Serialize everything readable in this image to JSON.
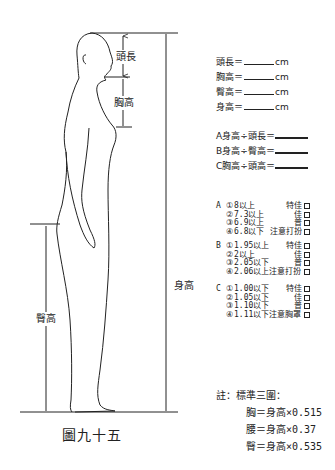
{
  "diagram": {
    "caption": "圖九十五",
    "labels": {
      "head_length": "頭長",
      "chest_height": "胸高",
      "body_height": "身高",
      "hip_height": "臀高"
    }
  },
  "measure_fields": [
    {
      "label": "頭長＝",
      "unit": "cm"
    },
    {
      "label": "胸高＝",
      "unit": "cm"
    },
    {
      "label": "臀高＝",
      "unit": "cm"
    },
    {
      "label": "身高＝",
      "unit": "cm"
    }
  ],
  "ratios": [
    {
      "text": "A身高÷頭長＝"
    },
    {
      "text": "B身高÷臀高＝"
    },
    {
      "text": "C胸高÷頭高＝"
    }
  ],
  "criteria": [
    {
      "key": "A",
      "items": [
        {
          "num": "①",
          "value": "8以上",
          "grade": "特佳"
        },
        {
          "num": "②",
          "value": "7.3以上",
          "grade": "佳"
        },
        {
          "num": "③",
          "value": "6.9以上",
          "grade": "普"
        },
        {
          "num": "④",
          "value": "6.8以下",
          "grade": "注意打扮"
        }
      ]
    },
    {
      "key": "B",
      "items": [
        {
          "num": "①",
          "value": "1.95以上",
          "grade": "特佳"
        },
        {
          "num": "②",
          "value": "2以上",
          "grade": "佳"
        },
        {
          "num": "③",
          "value": "2.05以下",
          "grade": "普"
        },
        {
          "num": "④",
          "value": "2.06以上注意打扮",
          "grade": ""
        }
      ]
    },
    {
      "key": "C",
      "items": [
        {
          "num": "①",
          "value": "1.00以下",
          "grade": "特佳"
        },
        {
          "num": "②",
          "value": "1.05以下",
          "grade": "佳"
        },
        {
          "num": "③",
          "value": "1.10以下",
          "grade": "普"
        },
        {
          "num": "④",
          "value": "1.11以下注意胸罩",
          "grade": ""
        }
      ]
    }
  ],
  "note": {
    "title": "註：標準三圍：",
    "lines": [
      "胸＝身高×0.515",
      "腰＝身高×0.37",
      "臀＝身高×0.535"
    ]
  }
}
